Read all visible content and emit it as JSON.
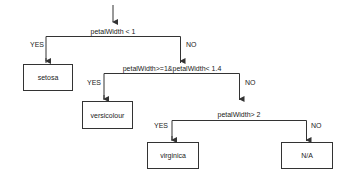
{
  "diagram": {
    "type": "decision-tree",
    "line_color": "#333333",
    "nodes": {
      "cond1": {
        "label": "petalWidth < 1",
        "yes_label": "YES",
        "no_label": "NO"
      },
      "cond2": {
        "label": "petalWidth>=1&petalWidth< 1.4",
        "yes_label": "YES",
        "no_label": "NO"
      },
      "cond3": {
        "label": "petalWidth> 2",
        "yes_label": "YES",
        "no_label": "NO"
      },
      "leaf_setosa": {
        "label": "setosa"
      },
      "leaf_versicolour": {
        "label": "versicolour"
      },
      "leaf_virginica": {
        "label": "virginica"
      },
      "leaf_na": {
        "label": "N/A"
      }
    },
    "edges": [
      {
        "from": "start",
        "to": "cond1"
      },
      {
        "from": "cond1",
        "to": "leaf_setosa",
        "label": "YES"
      },
      {
        "from": "cond1",
        "to": "cond2",
        "label": "NO"
      },
      {
        "from": "cond2",
        "to": "leaf_versicolour",
        "label": "YES"
      },
      {
        "from": "cond2",
        "to": "cond3",
        "label": "NO"
      },
      {
        "from": "cond3",
        "to": "leaf_virginica",
        "label": "YES"
      },
      {
        "from": "cond3",
        "to": "leaf_na",
        "label": "NO"
      }
    ]
  }
}
